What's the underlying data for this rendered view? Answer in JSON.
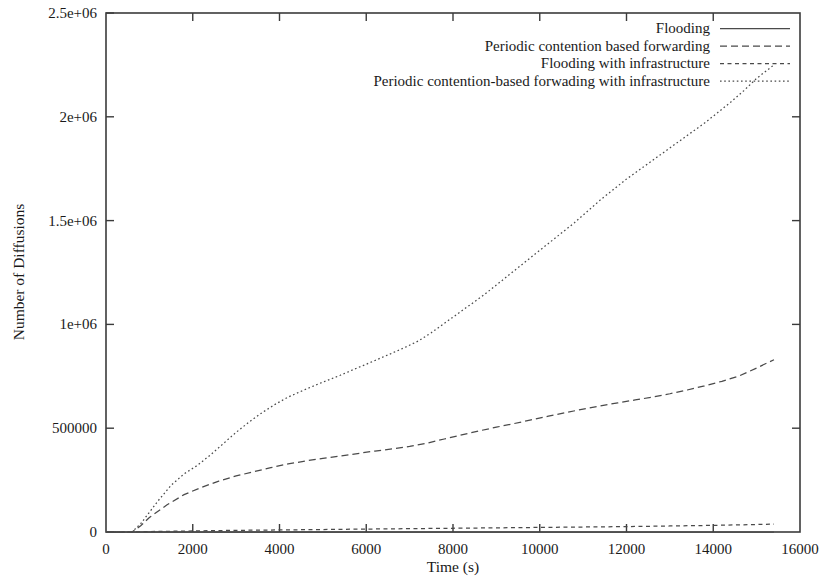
{
  "chart_data": {
    "type": "line",
    "title": "",
    "xlabel": "Time (s)",
    "ylabel": "Number of Diffusions",
    "xlim": [
      0,
      16000
    ],
    "ylim": [
      0,
      2500000
    ],
    "grid": false,
    "legend_position": "top-right",
    "xticks": [
      0,
      2000,
      4000,
      6000,
      8000,
      10000,
      12000,
      14000,
      16000
    ],
    "xtick_labels": [
      "0",
      "2000",
      "4000",
      "6000",
      "8000",
      "10000",
      "12000",
      "14000",
      "16000"
    ],
    "yticks": [
      0,
      500000,
      1000000,
      1500000,
      2000000,
      2500000
    ],
    "ytick_labels": [
      "0",
      "500000",
      "1e+06",
      "1.5e+06",
      "2e+06",
      "2.5e+06"
    ],
    "series": [
      {
        "name": "Flooding",
        "style": "solid",
        "x": [
          0,
          600,
          1000,
          2000,
          4000,
          6000,
          8000,
          10000,
          12000,
          14000,
          15400
        ],
        "values": [
          0,
          0,
          0,
          0,
          0,
          0,
          0,
          0,
          0,
          0,
          0
        ]
      },
      {
        "name": "Periodic contention based forwarding",
        "style": "dashed-long",
        "x": [
          0,
          600,
          800,
          1000,
          1400,
          1800,
          2200,
          2600,
          3000,
          3400,
          3800,
          4200,
          4600,
          5000,
          5400,
          5800,
          6200,
          6600,
          7000,
          7400,
          7800,
          8200,
          8600,
          9000,
          9400,
          9800,
          10200,
          10600,
          11000,
          11400,
          11800,
          12200,
          12600,
          13000,
          13400,
          13800,
          14200,
          14600,
          15000,
          15400
        ],
        "values": [
          0,
          0,
          30000,
          70000,
          130000,
          180000,
          215000,
          245000,
          270000,
          290000,
          310000,
          328000,
          342000,
          355000,
          366000,
          378000,
          390000,
          400000,
          412000,
          428000,
          448000,
          468000,
          487000,
          505000,
          522000,
          540000,
          558000,
          575000,
          592000,
          608000,
          622000,
          636000,
          650000,
          666000,
          684000,
          704000,
          726000,
          752000,
          790000,
          830000
        ]
      },
      {
        "name": "Flooding with infrastructure",
        "style": "dashed-short",
        "x": [
          0,
          600,
          1000,
          2000,
          3000,
          4000,
          5000,
          6000,
          7000,
          8000,
          9000,
          10000,
          11000,
          12000,
          13000,
          14000,
          15000,
          15400
        ],
        "values": [
          0,
          0,
          2000,
          5000,
          8000,
          10000,
          12000,
          14000,
          16000,
          18000,
          20000,
          22000,
          24000,
          26000,
          29000,
          32000,
          36000,
          38000
        ]
      },
      {
        "name": "Periodic contention-based forwading with infrastructure",
        "style": "dotted",
        "x": [
          0,
          600,
          800,
          1000,
          1200,
          1500,
          1800,
          2100,
          2400,
          2700,
          3000,
          3300,
          3600,
          3900,
          4200,
          4500,
          4800,
          5100,
          5400,
          5700,
          6000,
          6300,
          6600,
          6900,
          7200,
          7500,
          7800,
          8100,
          8400,
          8700,
          9000,
          9300,
          9600,
          9900,
          10200,
          10500,
          10800,
          11100,
          11400,
          11700,
          12000,
          12300,
          12600,
          12900,
          13200,
          13500,
          13800,
          14100,
          14400,
          14700,
          15000,
          15400
        ],
        "values": [
          0,
          0,
          40000,
          95000,
          150000,
          225000,
          280000,
          320000,
          370000,
          425000,
          480000,
          530000,
          575000,
          615000,
          650000,
          678000,
          705000,
          730000,
          755000,
          782000,
          808000,
          835000,
          862000,
          890000,
          920000,
          960000,
          1005000,
          1050000,
          1095000,
          1140000,
          1190000,
          1240000,
          1290000,
          1340000,
          1390000,
          1440000,
          1490000,
          1545000,
          1600000,
          1650000,
          1700000,
          1745000,
          1790000,
          1835000,
          1880000,
          1925000,
          1970000,
          2020000,
          2070000,
          2125000,
          2185000,
          2250000
        ]
      }
    ]
  },
  "legend": {
    "entries": [
      {
        "label": "Flooding",
        "style": "solid"
      },
      {
        "label": "Periodic contention based forwarding",
        "style": "dashed-long"
      },
      {
        "label": "Flooding with infrastructure",
        "style": "dashed-short"
      },
      {
        "label": "Periodic contention-based forwading with infrastructure",
        "style": "dotted"
      }
    ]
  },
  "axes": {
    "x_title": "Time (s)",
    "y_title": "Number of Diffusions"
  },
  "colors": {
    "line": "#4a4a4a",
    "frame": "#3b3b3b",
    "text": "#1a1a1a",
    "background": "#ffffff"
  }
}
